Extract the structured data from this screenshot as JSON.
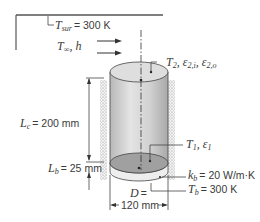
{
  "figure": {
    "type": "heat-transfer-schematic"
  },
  "labels": {
    "t_sur": {
      "sym": "T",
      "sub": "sur",
      "value": "= 300 K"
    },
    "t_inf_h": {
      "sym": "T",
      "sub": "∞",
      "rest": ", h"
    },
    "top_surface": {
      "sym": "T",
      "sub": "2",
      "rest1": ", ε",
      "sub1": "2,i",
      "rest2": ", ε",
      "sub2": "2,o"
    },
    "bottom_surface": {
      "sym": "T",
      "sub": "1",
      "rest": ", ε",
      "sub1": "1"
    },
    "lc": {
      "sym": "L",
      "sub": "c",
      "value": "= 200 mm"
    },
    "lb": {
      "sym": "L",
      "sub": "b",
      "value": "= 25",
      "unit": "mm"
    },
    "kb": {
      "sym": "k",
      "sub": "b",
      "value": "= 20 W/m·K"
    },
    "tb": {
      "sym": "T",
      "sub": "b",
      "value": "= 300 K"
    },
    "d": {
      "sym": "D",
      "value": "=",
      "dim": "120 mm"
    }
  },
  "colors": {
    "cylinder_side": "#d4d4d4",
    "cylinder_top": "#dcdcdc",
    "bottom_disk": "#9a9a9a",
    "base": "#e8e8e8",
    "insulation": "#c8c8c8",
    "line": "#444444"
  }
}
